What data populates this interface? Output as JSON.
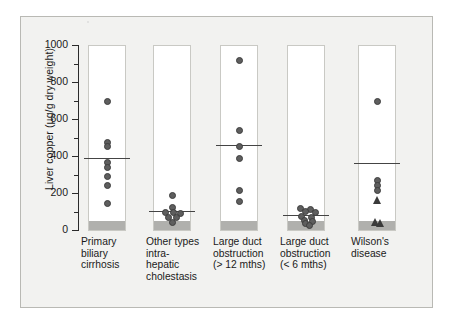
{
  "figure": {
    "background_color": "#f2f2f0",
    "border_color": "#b9b9b4"
  },
  "chart_data": {
    "type": "scatter",
    "title": "",
    "subtitle": "",
    "xlabel": "",
    "ylabel": "Liver copper (µg/g dry weight)",
    "ylim": [
      0,
      1000
    ],
    "ytick_labels": [
      "0",
      "200",
      "400",
      "600",
      "800",
      "1000"
    ],
    "ytick_values": [
      0,
      200,
      400,
      600,
      800,
      1000
    ],
    "yminor_step": 100,
    "grid": false,
    "legend": "none",
    "marker_color": "#5e5e5e",
    "mean_line_color": "#444444",
    "normal_range_color": "#b0b0ad",
    "normal_range": [
      0,
      50
    ],
    "categories": [
      "Primary biliary cirrhosis",
      "Other types intra-hepatic cholestasis",
      "Large duct obstruction (> 12 mths)",
      "Large duct obstruction (< 6 mths)",
      "Wilson's disease"
    ],
    "groups": [
      {
        "label_lines": [
          "Primary",
          "biliary",
          "cirrhosis"
        ],
        "mean": 388,
        "points": [
          {
            "value": 692,
            "offset": 0,
            "marker": "circle"
          },
          {
            "value": 472,
            "offset": 0,
            "marker": "circle"
          },
          {
            "value": 452,
            "offset": 0,
            "marker": "circle"
          },
          {
            "value": 366,
            "offset": 0,
            "marker": "circle"
          },
          {
            "value": 338,
            "offset": 0,
            "marker": "circle"
          },
          {
            "value": 288,
            "offset": 0,
            "marker": "circle"
          },
          {
            "value": 240,
            "offset": 0,
            "marker": "circle"
          },
          {
            "value": 142,
            "offset": 0,
            "marker": "circle"
          }
        ]
      },
      {
        "label_lines": [
          "Other types",
          "intra-",
          "hepatic",
          "cholestasis"
        ],
        "mean": 104,
        "points": [
          {
            "value": 188,
            "offset": 0,
            "marker": "circle"
          },
          {
            "value": 122,
            "offset": 0,
            "marker": "circle"
          },
          {
            "value": 96,
            "offset": -7,
            "marker": "circle"
          },
          {
            "value": 92,
            "offset": 1,
            "marker": "circle"
          },
          {
            "value": 88,
            "offset": 8,
            "marker": "circle"
          },
          {
            "value": 70,
            "offset": -4,
            "marker": "circle"
          },
          {
            "value": 68,
            "offset": 4,
            "marker": "circle"
          },
          {
            "value": 40,
            "offset": 0,
            "marker": "circle"
          }
        ]
      },
      {
        "label_lines": [
          "Large duct",
          "obstruction",
          "(> 12 mths)"
        ],
        "mean": 462,
        "points": [
          {
            "value": 918,
            "offset": 0,
            "marker": "circle"
          },
          {
            "value": 540,
            "offset": 0,
            "marker": "circle"
          },
          {
            "value": 450,
            "offset": 0,
            "marker": "circle"
          },
          {
            "value": 384,
            "offset": 0,
            "marker": "circle"
          },
          {
            "value": 214,
            "offset": 0,
            "marker": "circle"
          },
          {
            "value": 152,
            "offset": 0,
            "marker": "circle"
          }
        ]
      },
      {
        "label_lines": [
          "Large duct",
          "obstruction",
          "(< 6 mths)"
        ],
        "mean": 82,
        "points": [
          {
            "value": 118,
            "offset": -6,
            "marker": "circle"
          },
          {
            "value": 112,
            "offset": 4,
            "marker": "circle"
          },
          {
            "value": 100,
            "offset": -1,
            "marker": "circle"
          },
          {
            "value": 92,
            "offset": 9,
            "marker": "circle"
          },
          {
            "value": 74,
            "offset": -5,
            "marker": "circle"
          },
          {
            "value": 66,
            "offset": 5,
            "marker": "circle"
          },
          {
            "value": 52,
            "offset": -2,
            "marker": "circle"
          },
          {
            "value": 44,
            "offset": 6,
            "marker": "circle"
          },
          {
            "value": 36,
            "offset": -1,
            "marker": "circle"
          },
          {
            "value": 26,
            "offset": 3,
            "marker": "circle"
          }
        ]
      },
      {
        "label_lines": [
          "Wilson's",
          "disease"
        ],
        "mean": 360,
        "points": [
          {
            "value": 692,
            "offset": 0,
            "marker": "circle"
          },
          {
            "value": 268,
            "offset": 0,
            "marker": "circle"
          },
          {
            "value": 240,
            "offset": 0,
            "marker": "circle"
          },
          {
            "value": 212,
            "offset": 0,
            "marker": "circle"
          },
          {
            "value": 162,
            "offset": 0,
            "marker": "triangle"
          },
          {
            "value": 44,
            "offset": -2,
            "marker": "triangle"
          },
          {
            "value": 38,
            "offset": 3,
            "marker": "triangle"
          }
        ]
      }
    ]
  }
}
